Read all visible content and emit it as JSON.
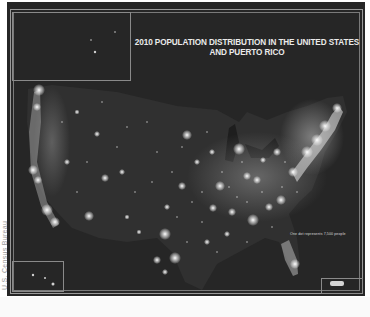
{
  "map": {
    "title_line1": "2010 POPULATION DISTRIBUTION IN THE UNITED STATES",
    "title_line2": "AND PUERTO RICO",
    "legend": "One dot represents 7,500 people",
    "credit": "U.S. Census Bureau",
    "insets": [
      "Alaska",
      "Hawaii",
      "Puerto Rico"
    ],
    "colors": {
      "background": "#262626",
      "land": "#2e2e2e",
      "lights": "#ffffff",
      "frame": "#9a9a9a",
      "title": "#eaeaea"
    }
  }
}
